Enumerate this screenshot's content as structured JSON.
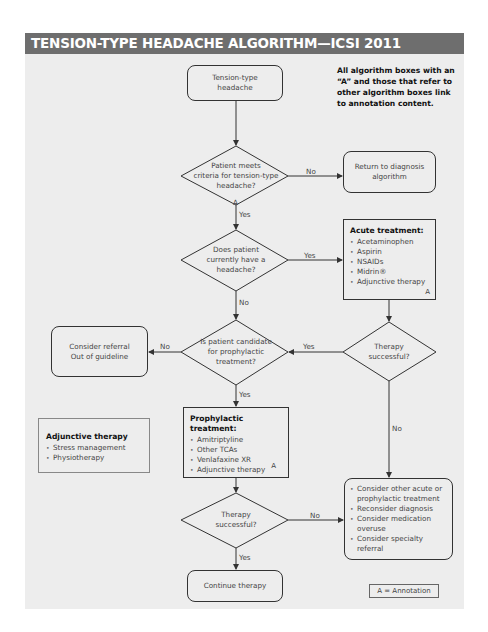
{
  "header": {
    "title": "TENSION-TYPE HEADACHE ALGORITHM—ICSI 2011"
  },
  "note": "All algorithm boxes with an “A” and those that refer to other algorithm boxes link to annotation content.",
  "nodes": {
    "start": {
      "text": "Tension-type headache"
    },
    "criteria": {
      "line1": "Patient meets",
      "line2": "criteria for tension-type",
      "line3": "headache?",
      "annotation": "A"
    },
    "return_diag": {
      "text": "Return to diagnosis algorithm"
    },
    "current_headache": {
      "line1": "Does patient",
      "line2": "currently have a",
      "line3": "headache?"
    },
    "acute": {
      "title": "Acute treatment:",
      "items": [
        "Acetaminophen",
        "Aspirin",
        "NSAIDs",
        "Midrin®",
        "Adjunctive therapy"
      ],
      "annotation": "A"
    },
    "therapy_success_1": {
      "line1": "Therapy",
      "line2": "successful?"
    },
    "prophylactic_candidate": {
      "line1": "Is patient candidate",
      "line2": "for prophylactic",
      "line3": "treatment?"
    },
    "referral": {
      "line1": "Consider referral",
      "line2": "Out of guideline"
    },
    "adjunctive": {
      "title": "Adjunctive therapy",
      "items": [
        "Stress management",
        "Physiotherapy"
      ]
    },
    "prophylactic": {
      "title": "Prophylactic treatment:",
      "items": [
        "Amitriptyline",
        "Other TCAs",
        "Venlafaxine XR",
        "Adjunctive therapy"
      ],
      "annotation": "A"
    },
    "therapy_success_2": {
      "line1": "Therapy",
      "line2": "successful?"
    },
    "consider": {
      "items": [
        "Consider other acute or prophylactic treatment",
        "Reconsider diagnosis",
        "Consider medication overuse",
        "Consider specialty referral"
      ]
    },
    "continue": {
      "text": "Continue therapy"
    }
  },
  "edges": {
    "criteria_no": "No",
    "criteria_yes": "Yes",
    "current_yes": "Yes",
    "current_no": "No",
    "candidate_no": "No",
    "candidate_yes": "Yes",
    "therapy1_yes": "Yes",
    "therapy1_no": "No",
    "therapy2_no": "No",
    "therapy2_yes": "Yes"
  },
  "legend": {
    "text": "A = Annotation"
  },
  "colors": {
    "header_bg": "#6e6e6e",
    "panel_bg": "#ededed",
    "line": "#333333"
  }
}
